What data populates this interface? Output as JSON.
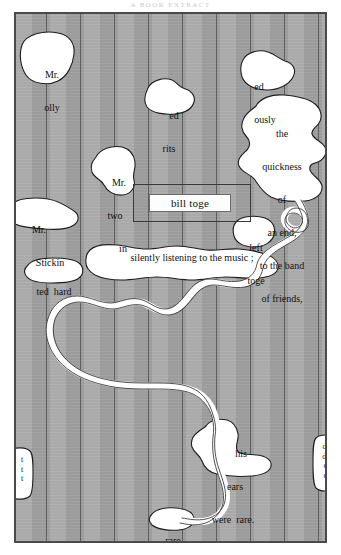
{
  "page": {
    "running_head": "A BOOK EXTRACT",
    "background_color": "#a8a8a8",
    "ink_color": "#111111",
    "cutout_color": "#ffffff"
  },
  "boxed_caption": {
    "text": "bill toge"
  },
  "band": {
    "text": "silently listening  to  the  music ;"
  },
  "fragments": [
    {
      "id": "mr-olly",
      "lines": [
        "Mr.",
        "olly"
      ]
    },
    {
      "id": "ed-rits",
      "lines": [
        "ed",
        "rits"
      ]
    },
    {
      "id": "ed-ously",
      "lines": [
        "ed",
        "ously"
      ]
    },
    {
      "id": "quickness",
      "lines": [
        "the",
        "quickness",
        "of",
        "an end,",
        "to the band",
        "of friends,"
      ]
    },
    {
      "id": "mr-two-in",
      "lines": [
        "Mr.",
        "two",
        "in"
      ]
    },
    {
      "id": "mr-stickin",
      "lines": [
        "Mr.",
        "Stickin"
      ]
    },
    {
      "id": "left-toge",
      "lines": [
        "left",
        "toge"
      ]
    },
    {
      "id": "ted-hard",
      "lines": [
        "ted  hard"
      ]
    },
    {
      "id": "his-ears",
      "lines": [
        "his",
        "ears",
        "were  rare."
      ]
    },
    {
      "id": "rare",
      "lines": [
        "rare"
      ]
    }
  ],
  "slivers": [
    {
      "id": "left-sliver",
      "lines": [
        "t",
        "t",
        "t"
      ]
    },
    {
      "id": "right-sliver",
      "lines": [
        "d.",
        "d-",
        "d",
        "d"
      ]
    }
  ]
}
